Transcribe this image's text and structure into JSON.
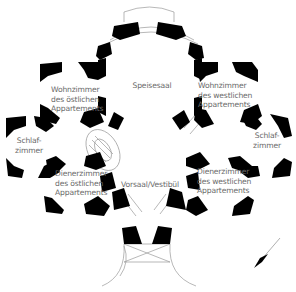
{
  "plan": {
    "title": "Grundriss",
    "colors": {
      "wall": "#000000",
      "line": "#9a9a9a",
      "label": "#6a6a6a",
      "background": "#ffffff"
    },
    "rooms": [
      {
        "id": "speisesaal",
        "lines": [
          "Speisesaal"
        ]
      },
      {
        "id": "wohnzimmer-ost",
        "lines": [
          "Wohnzimmer",
          "des östlichen",
          "Appartements"
        ]
      },
      {
        "id": "wohnzimmer-west",
        "lines": [
          "Wohnzimmer",
          "des westlichen",
          "Appartements"
        ]
      },
      {
        "id": "schlafzimmer-ost",
        "lines": [
          "Schlaf-",
          "zimmer"
        ]
      },
      {
        "id": "schlafzimmer-west",
        "lines": [
          "Schlaf-",
          "zimmer"
        ]
      },
      {
        "id": "dienerzimmer-ost",
        "lines": [
          "Dienerzimmer",
          "des östlichen",
          "Appartements"
        ]
      },
      {
        "id": "dienerzimmer-west",
        "lines": [
          "Dienerzimmer",
          "des westlichen",
          "Appartements"
        ]
      },
      {
        "id": "vorsaal",
        "lines": [
          "Vorsaal/Vestibül"
        ]
      }
    ],
    "north_arrow": {
      "icon": "north-arrow-icon"
    }
  }
}
